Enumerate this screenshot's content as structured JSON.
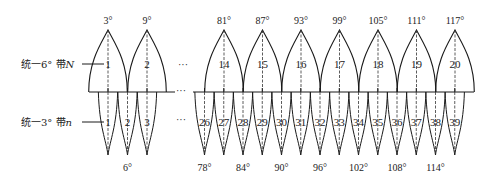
{
  "diagram": {
    "legend": {
      "zone6_label": "统一6° 带",
      "zone6_var": "N",
      "zone3_label": "统一3° 带",
      "zone3_var": "n"
    },
    "ellipsis": "···",
    "zones_6deg": [
      {
        "number": "1",
        "central_meridian": "3°"
      },
      {
        "number": "2",
        "central_meridian": "9°"
      },
      {
        "number": "14",
        "central_meridian": "81°"
      },
      {
        "number": "15",
        "central_meridian": "87°"
      },
      {
        "number": "16",
        "central_meridian": "93°"
      },
      {
        "number": "17",
        "central_meridian": "99°"
      },
      {
        "number": "18",
        "central_meridian": "105°"
      },
      {
        "number": "19",
        "central_meridian": "111°"
      },
      {
        "number": "20",
        "central_meridian": "117°"
      }
    ],
    "zones_3deg_left": [
      "1",
      "2",
      "3"
    ],
    "zones_3deg_right": [
      "26",
      "27",
      "28",
      "29",
      "30",
      "31",
      "32",
      "33",
      "34",
      "35",
      "36",
      "37",
      "38",
      "39"
    ],
    "bottom_meridians": [
      {
        "label": "6°"
      },
      {
        "label": "78°"
      },
      {
        "label": "84°"
      },
      {
        "label": "90°"
      },
      {
        "label": "96°"
      },
      {
        "label": "102°"
      },
      {
        "label": "108°"
      },
      {
        "label": "114°"
      }
    ],
    "colors": {
      "line": "#1a1a1a",
      "background": "#ffffff"
    }
  }
}
